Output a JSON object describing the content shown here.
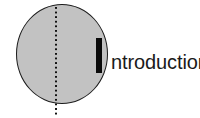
{
  "figure": {
    "title_full": "Introduction",
    "label_text": "ntroduction",
    "initial_letter": "I",
    "colors": {
      "disc_fill": "#c2c2c2",
      "disc_outline": "#1c1c1c",
      "dotted_line": "#111111",
      "initial_letter": "#0a0a0a",
      "label_text": "#1a1a1a",
      "background": "#ffffff"
    },
    "shapes": {
      "disc": {
        "name": "circle",
        "left": 16,
        "top": 4,
        "width": 92,
        "height": 100
      },
      "dotted_axis": {
        "name": "vertical-dotted-line",
        "x": 55,
        "top": 7,
        "bottom": 116,
        "dot_size": 2,
        "dot_gap": 2.6
      },
      "initial_bar": {
        "name": "bold-letter-i-bar",
        "left": 96,
        "top": 38,
        "width": 6,
        "height": 35
      }
    }
  }
}
